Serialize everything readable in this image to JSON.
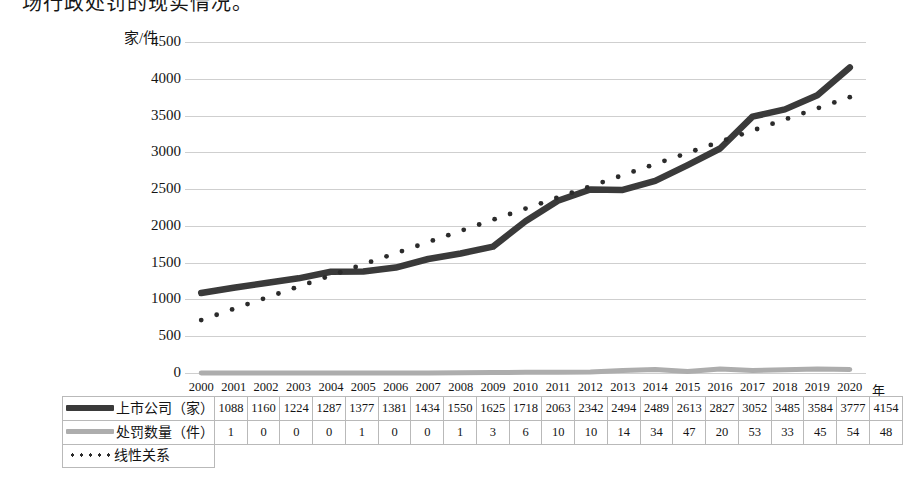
{
  "top_text": "场行政处罚的现实情况。",
  "chart_data": {
    "type": "line",
    "title": "",
    "xlabel": "年",
    "ylabel": "家/件",
    "ylim": [
      0,
      4500
    ],
    "ytick_step": 500,
    "yticks": [
      "0",
      "500",
      "1000",
      "1500",
      "2000",
      "2500",
      "3000",
      "3500",
      "4000",
      "4500"
    ],
    "grid": true,
    "legend_position": "table-left",
    "categories": [
      "2000",
      "2001",
      "2002",
      "2003",
      "2004",
      "2005",
      "2006",
      "2007",
      "2008",
      "2009",
      "2010",
      "2011",
      "2012",
      "2013",
      "2014",
      "2015",
      "2016",
      "2017",
      "2018",
      "2019",
      "2020"
    ],
    "series": [
      {
        "name": "上市公司（家）",
        "style": "solid-thick",
        "color": "#3a3a3a",
        "values": [
          1088,
          1160,
          1224,
          1287,
          1377,
          1381,
          1434,
          1550,
          1625,
          1718,
          2063,
          2342,
          2494,
          2489,
          2613,
          2827,
          3052,
          3485,
          3584,
          3777,
          4154
        ]
      },
      {
        "name": "处罚数量（件）",
        "style": "solid-gray",
        "color": "#adadad",
        "values": [
          1,
          0,
          0,
          0,
          1,
          0,
          0,
          1,
          3,
          6,
          10,
          10,
          14,
          34,
          47,
          20,
          53,
          33,
          45,
          54,
          48
        ]
      },
      {
        "name": "线性关系",
        "style": "dotted",
        "color": "#2b2b2b",
        "values": [
          720,
          871,
          1023,
          1174,
          1326,
          1477,
          1629,
          1780,
          1932,
          2083,
          2235,
          2386,
          2538,
          2689,
          2841,
          2992,
          3144,
          3295,
          3447,
          3598,
          3750
        ]
      }
    ]
  },
  "table": {
    "header_label": "",
    "years": [
      "2000",
      "2001",
      "2002",
      "2003",
      "2004",
      "2005",
      "2006",
      "2007",
      "2008",
      "2009",
      "2010",
      "2011",
      "2012",
      "2013",
      "2014",
      "2015",
      "2016",
      "2017",
      "2018",
      "2019",
      "2020"
    ],
    "rows": [
      {
        "label": "上市公司（家）",
        "swatch": "solid-dark-line-icon",
        "values": [
          "1088",
          "1160",
          "1224",
          "1287",
          "1377",
          "1381",
          "1434",
          "1550",
          "1625",
          "1718",
          "2063",
          "2342",
          "2494",
          "2489",
          "2613",
          "2827",
          "3052",
          "3485",
          "3584",
          "3777",
          "4154"
        ]
      },
      {
        "label": "处罚数量（件）",
        "swatch": "solid-gray-line-icon",
        "values": [
          "1",
          "0",
          "0",
          "0",
          "1",
          "0",
          "0",
          "1",
          "3",
          "6",
          "10",
          "10",
          "14",
          "34",
          "47",
          "20",
          "53",
          "33",
          "45",
          "54",
          "48"
        ]
      }
    ],
    "footer_row": {
      "label": "线性关系",
      "swatch": "dotted-line-icon"
    }
  }
}
